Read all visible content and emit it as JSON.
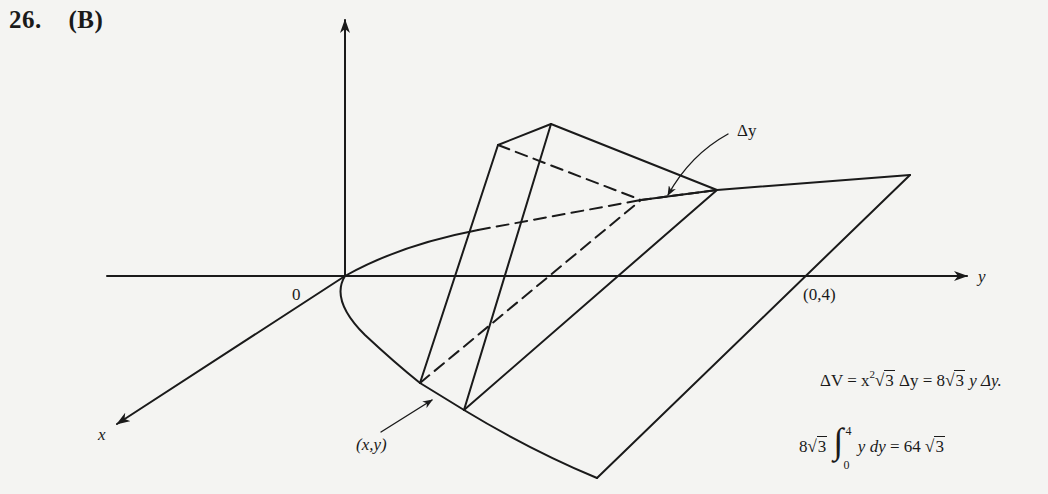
{
  "header": {
    "problem_number": "26.",
    "answer_choice": "(B)"
  },
  "diagram": {
    "axes": {
      "vertical_axis_label": "",
      "y_axis_label": "y",
      "x_axis_label": "x",
      "origin_label": "0",
      "point_label": "(0,4)"
    },
    "annotations": {
      "delta_y_label": "Δy",
      "point_xy_label": "(x,y)"
    },
    "colors": {
      "ink": "#1a1a1a",
      "paper": "#f4f4f2"
    }
  },
  "formulas": {
    "volume_element": {
      "lhs": "ΔV = x",
      "exp": "2",
      "sqrt1": "3",
      "mid": " Δy = 8",
      "sqrt2": "3",
      "rhs": " y Δy."
    },
    "integral": {
      "coef": "8",
      "sqrt": "3",
      "upper": "4",
      "lower": "0",
      "integrand": "y dy",
      "equals": " = 64 ",
      "result_sqrt": "3"
    }
  }
}
